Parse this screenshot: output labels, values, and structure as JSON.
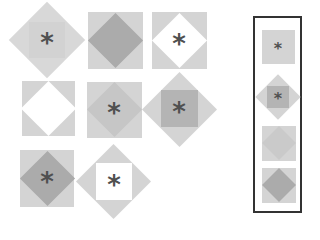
{
  "puzzle": {
    "type": "figure-matrix-reasoning",
    "colors": {
      "light": "#d8d8d8",
      "mid": "#c4c4c4",
      "dark": "#ababab",
      "white": "#ffffff",
      "asterisk": "#505050",
      "frame": "#333333"
    },
    "symbol": "*",
    "matrix": [
      {
        "cell": 1,
        "outer": "diamond",
        "outer_fill": "light",
        "inner": "square",
        "inner_fill": "light",
        "asterisk": true
      },
      {
        "cell": 2,
        "outer": "square",
        "outer_fill": "light",
        "inner": "diamond",
        "inner_fill": "dark",
        "asterisk": false
      },
      {
        "cell": 3,
        "outer": "square",
        "outer_fill": "light",
        "inner": "diamond",
        "inner_fill": "white",
        "asterisk": true
      },
      {
        "cell": 4,
        "outer": "square",
        "outer_fill": "light",
        "inner": "diamond",
        "inner_fill": "white",
        "asterisk": false
      },
      {
        "cell": 5,
        "outer": "square",
        "outer_fill": "light",
        "inner": "diamond",
        "inner_fill": "mid",
        "asterisk": true
      },
      {
        "cell": 6,
        "outer": "diamond",
        "outer_fill": "light",
        "inner": "square",
        "inner_fill": "dark",
        "asterisk": true
      },
      {
        "cell": 7,
        "outer": "square",
        "outer_fill": "light",
        "inner": "diamond",
        "inner_fill": "dark",
        "asterisk": true
      },
      {
        "cell": 8,
        "outer": "diamond",
        "outer_fill": "light",
        "inner": "square",
        "inner_fill": "white",
        "asterisk": true
      }
    ],
    "options": [
      {
        "option": 1,
        "outer": "square",
        "outer_fill": "light",
        "inner": "none",
        "asterisk": true
      },
      {
        "option": 2,
        "outer": "diamond",
        "outer_fill": "light",
        "inner": "square",
        "inner_fill": "dark",
        "asterisk": true
      },
      {
        "option": 3,
        "outer": "square",
        "outer_fill": "light",
        "inner": "diamond",
        "inner_fill": "mid",
        "asterisk": false
      },
      {
        "option": 4,
        "outer": "square",
        "outer_fill": "light",
        "inner": "diamond",
        "inner_fill": "dark",
        "asterisk": false
      }
    ]
  }
}
